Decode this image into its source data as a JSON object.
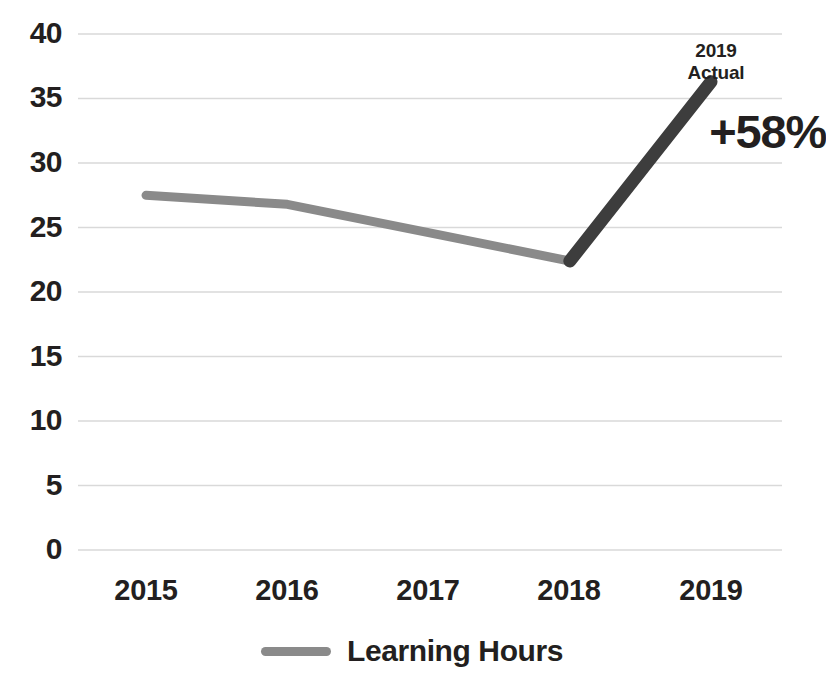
{
  "chart_data": {
    "type": "line",
    "title": "",
    "xlabel": "",
    "ylabel": "",
    "categories": [
      "2015",
      "2016",
      "2017",
      "2018",
      "2019"
    ],
    "series": [
      {
        "name": "Learning Hours",
        "values": [
          27.5,
          26.8,
          24.6,
          22.4,
          36.3
        ],
        "color": "#8a8a8a",
        "highlight_color": "#3d3d3d",
        "highlight_segment": [
          3,
          4
        ]
      }
    ],
    "ylim": [
      0,
      40
    ],
    "yticks": [
      0,
      5,
      10,
      15,
      20,
      25,
      30,
      35,
      40
    ],
    "ytick_labels": [
      "0",
      "5",
      "10",
      "15",
      "20",
      "25",
      "30",
      "35",
      "40"
    ],
    "grid": true,
    "grid_color": "#d9d9d9",
    "legend_position": "bottom",
    "annotations": [
      {
        "name": "2019-actual-callout",
        "line1": "2019",
        "line2": "Actual",
        "value": "+58%"
      }
    ]
  },
  "axes": {
    "y_labels": [
      "40",
      "35",
      "30",
      "25",
      "20",
      "15",
      "10",
      "5",
      "0"
    ],
    "x_labels": [
      "2015",
      "2016",
      "2017",
      "2018",
      "2019"
    ]
  },
  "legend": {
    "items": [
      {
        "label": "Learning Hours",
        "color": "#8a8a8a"
      }
    ]
  },
  "annotation": {
    "line1": "2019",
    "line2": "Actual",
    "value": "+58%"
  },
  "colors": {
    "line": "#8a8a8a",
    "line_highlight": "#3d3d3d",
    "grid": "#d9d9d9",
    "text": "#231f20",
    "background": "#ffffff"
  }
}
